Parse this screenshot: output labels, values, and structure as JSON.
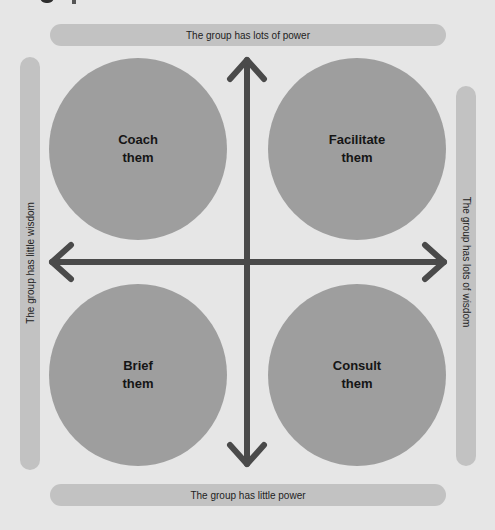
{
  "diagram": {
    "labels": {
      "top": "The group has lots of power",
      "bottom": "The group has little power",
      "left": "The group has little wisdom",
      "right": "The group has lots of wisdom"
    },
    "quadrants": [
      {
        "position": "top-left",
        "line1": "Coach",
        "line2": "them"
      },
      {
        "position": "top-right",
        "line1": "Facilitate",
        "line2": "them"
      },
      {
        "position": "bottom-left",
        "line1": "Brief",
        "line2": "them"
      },
      {
        "position": "bottom-right",
        "line1": "Consult",
        "line2": "them"
      }
    ],
    "axes": {
      "vertical": "power",
      "horizontal": "wisdom"
    },
    "colors": {
      "background": "#e6e6e6",
      "bar": "#c2c2c2",
      "circle": "#9e9e9e",
      "arrow": "#4a4a4a"
    }
  }
}
